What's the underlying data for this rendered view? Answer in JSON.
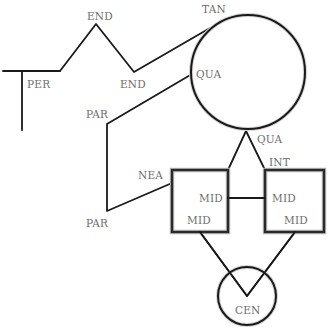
{
  "diagram": {
    "colors": {
      "line": "#1a1a1a",
      "label": "#6e6e6e",
      "background": "#ffffff"
    },
    "labels": {
      "per": "PER",
      "end_top": "END",
      "end_bottom": "END",
      "tan": "TAN",
      "qua_left": "QUA",
      "qua_bottom": "QUA",
      "par_top": "PAR",
      "par_bottom": "PAR",
      "nea": "NEA",
      "int": "INT",
      "mid_left_box_right": "MID",
      "mid_left_box_bottom": "MID",
      "mid_right_box_left": "MID",
      "mid_right_box_bottom": "MID",
      "cen": "CEN"
    }
  }
}
